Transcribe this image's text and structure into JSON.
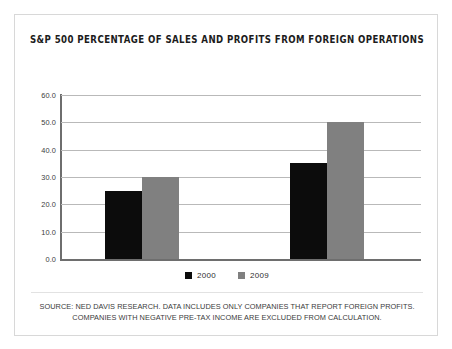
{
  "chart_data": {
    "type": "bar",
    "title": "S&P 500 PERCENTAGE OF SALES AND PROFITS FROM FOREIGN OPERATIONS",
    "xlabel": "",
    "ylabel": "",
    "categories": [
      "Sales",
      "Profits"
    ],
    "series": [
      {
        "name": "2000",
        "color": "#0c0c0c",
        "values": [
          25.0,
          35.0
        ]
      },
      {
        "name": "2009",
        "color": "#808080",
        "values": [
          30.0,
          50.0
        ]
      }
    ],
    "ylim": [
      0.0,
      60.0
    ],
    "ytick_step": 10.0,
    "ytick_labels": [
      "60.0",
      "50.0",
      "40.0",
      "30.0",
      "20.0",
      "10.0",
      "0.0"
    ],
    "ytick_values": [
      60.0,
      50.0,
      40.0,
      30.0,
      20.0,
      10.0,
      0.0
    ],
    "grid": true,
    "grid_axis": "y",
    "legend_position": "bottom",
    "xtick_labels_visible": false
  },
  "legend": {
    "items": [
      {
        "label": "2000",
        "swatch": "#0c0c0c"
      },
      {
        "label": "2009",
        "swatch": "#808080"
      }
    ]
  },
  "footnote": {
    "text": "SOURCE: NED DAVIS RESEARCH. DATA INCLUDES ONLY COMPANIES THAT REPORT FOREIGN PROFITS. COMPANIES WITH NEGATIVE PRE-TAX INCOME ARE EXCLUDED FROM CALCULATION."
  },
  "colors": {
    "series_2000": "#0c0c0c",
    "series_2009": "#808080",
    "gridline": "#b9b9b9",
    "axis": "#6e6e6e",
    "border": "#d8d8d8",
    "background": "#ffffff"
  }
}
